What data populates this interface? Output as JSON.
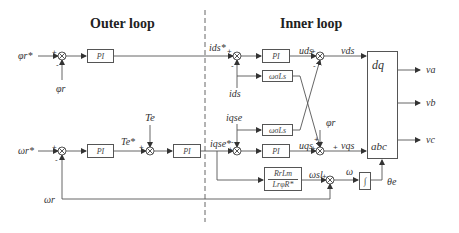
{
  "titles": {
    "outer": "Outer loop",
    "inner": "Inner loop"
  },
  "blocks": {
    "pi_flux": "PI",
    "pi_speed": "PI",
    "pi_torque": "PI",
    "pi_ids": "PI",
    "pi_iqs": "PI",
    "decouple_d": "ωσLs",
    "decouple_q": "ωσLs",
    "slip_num": "RrLm",
    "slip_den": "LrφR*",
    "integrator": "∫",
    "transform_top": "dq",
    "transform_bottom": "abc"
  },
  "signals": {
    "flux_ref": "φr*",
    "flux_fb": "φr",
    "speed_ref": "ωr*",
    "speed_fb": "ωr",
    "torque_ref": "Te*",
    "torque_fb": "Te",
    "ids_ref": "ids*",
    "ids_fb": "ids",
    "iqs_ref": "iqse*",
    "iqs_fb": "iqse",
    "u_ds": "uds",
    "u_qs": "uqs",
    "v_ds": "vds",
    "v_qs": "vqs",
    "flux_ff": "φr",
    "slip": "ωsl",
    "omega": "ω",
    "theta": "θe",
    "va": "va",
    "vb": "vb",
    "vc": "vc"
  },
  "signs": {
    "plus": "+",
    "minus": "-"
  }
}
